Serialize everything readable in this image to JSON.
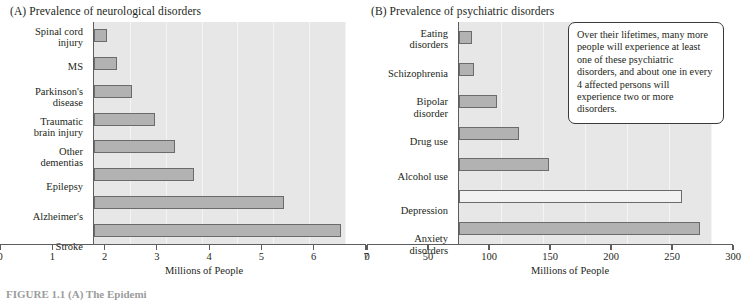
{
  "figure": {
    "caption": "FIGURE 1.1   (A)  The Epidemi"
  },
  "panels": [
    {
      "key": "A",
      "title": "(A)  Prevalence of neurological disorders"
    },
    {
      "key": "B",
      "title": "(B)  Prevalence of psychiatric disorders"
    }
  ],
  "callout": {
    "text": "Over their lifetimes, many more people will experience at least one of these psychiatric disorders, and about one in every 4 affected persons will experience two or more disorders."
  },
  "colors": {
    "plot_background": "#e7e7e7",
    "gridline": "#f4f4f4",
    "bar_fill": "#b2b2b2",
    "bar_fill_light": "#f2f2f2",
    "bar_stroke": "#6b6b6b",
    "axis": "#5d5d5d",
    "text": "#231f20"
  },
  "chart_data": [
    {
      "type": "bar",
      "orientation": "horizontal",
      "panel": "A",
      "title": "(A)  Prevalence of neurological disorders",
      "xlabel": "Millions of People",
      "ylabel": "",
      "xlim": [
        0,
        7
      ],
      "xticks": [
        0,
        1,
        2,
        3,
        4,
        5,
        6,
        7
      ],
      "xticklabels": [
        "0",
        "1",
        "2",
        "3",
        "4",
        "5",
        "6",
        "7"
      ],
      "grid": true,
      "legend": "none",
      "categories": [
        "Spinal cord\ninjury",
        "MS",
        "Parkinson's\ndisease",
        "Traumatic\nbrain injury",
        "Other\ndementias",
        "Epilepsy",
        "Alzheimer's",
        "Stroke"
      ],
      "values": [
        0.35,
        0.65,
        1.05,
        1.7,
        2.25,
        2.8,
        5.3,
        6.9
      ]
    },
    {
      "type": "bar",
      "orientation": "horizontal",
      "panel": "B",
      "title": "(B)  Prevalence of psychiatric disorders",
      "xlabel": "Millions of People",
      "ylabel": "",
      "xlim": [
        0,
        300
      ],
      "xticks": [
        0,
        50,
        100,
        150,
        200,
        250,
        300
      ],
      "xticklabels": [
        "0",
        "50",
        "100",
        "150",
        "200",
        "250",
        "300"
      ],
      "grid": true,
      "legend": "none",
      "categories": [
        "Eating\ndisorders",
        "Schizophrenia",
        "Bipolar\ndisorder",
        "Drug use",
        "Alcohol use",
        "Depression",
        "Anxiety\ndisorders"
      ],
      "values": [
        15,
        18,
        45,
        72,
        107,
        266,
        287
      ],
      "highlight_index": 5
    }
  ]
}
